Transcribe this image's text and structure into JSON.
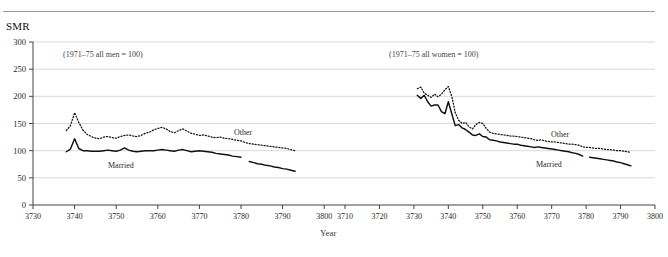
{
  "figure": {
    "y_axis_title": "SMR",
    "x_axis_title": "Year"
  },
  "chart_data": {
    "type": "line",
    "title": "SMR",
    "ylabel": "SMR",
    "xlabel": "Year",
    "ylim": [
      0,
      300
    ],
    "yticks": [
      0,
      50,
      100,
      150,
      200,
      250,
      300
    ],
    "grid": true,
    "legend_position": "inline-labels",
    "panels": [
      {
        "name": "men",
        "annotation": "(1971–75 all men = 100)",
        "xlim": [
          3730,
          3805
        ],
        "xticks": [
          3730,
          3740,
          3750,
          3760,
          3770,
          3780,
          3790,
          3800,
          3810
        ],
        "series": [
          {
            "name": "Other",
            "style": "dotted",
            "label": "Other",
            "x": [
              3738,
              3739,
              3740,
              3741,
              3742,
              3743,
              3744,
              3745,
              3746,
              3747,
              3748,
              3749,
              3750,
              3751,
              3752,
              3753,
              3754,
              3755,
              3756,
              3757,
              3758,
              3759,
              3760,
              3761,
              3762,
              3763,
              3764,
              3765,
              3766,
              3767,
              3768,
              3769,
              3770,
              3771,
              3772,
              3773,
              3774,
              3775,
              3776,
              3777,
              3778,
              3779,
              3780,
              3781,
              3782,
              3783,
              3784,
              3785,
              3786,
              3787,
              3788,
              3789,
              3790,
              3791,
              3792,
              3793
            ],
            "values": [
              137,
              146,
              170,
              152,
              138,
              130,
              126,
              123,
              122,
              125,
              126,
              124,
              123,
              126,
              128,
              129,
              127,
              126,
              128,
              132,
              134,
              138,
              141,
              143,
              140,
              135,
              133,
              137,
              140,
              136,
              132,
              130,
              128,
              129,
              127,
              125,
              124,
              125,
              123,
              122,
              121,
              119,
              118,
              115,
              113,
              112,
              111,
              110,
              109,
              108,
              107,
              106,
              105,
              104,
              102,
              100
            ]
          },
          {
            "name": "Married",
            "style": "solid",
            "label": "Married",
            "segments": [
              {
                "x": [
                  3738,
                  3739,
                  3740,
                  3741,
                  3742,
                  3743,
                  3744,
                  3745,
                  3746,
                  3747,
                  3748,
                  3749,
                  3750,
                  3751,
                  3752,
                  3753,
                  3754,
                  3755,
                  3756,
                  3757,
                  3758,
                  3759,
                  3760,
                  3761,
                  3762,
                  3763,
                  3764,
                  3765,
                  3766,
                  3767,
                  3768,
                  3769,
                  3770,
                  3771,
                  3772,
                  3773,
                  3774,
                  3775,
                  3776,
                  3777,
                  3778,
                  3779,
                  3780
                ],
                "values": [
                  98,
                  103,
                  122,
                  104,
                  100,
                  100,
                  99,
                  99,
                  99,
                  100,
                  101,
                  100,
                  99,
                  101,
                  105,
                  101,
                  99,
                  98,
                  99,
                  100,
                  100,
                  100,
                  101,
                  102,
                  101,
                  100,
                  99,
                  101,
                  102,
                  100,
                  98,
                  99,
                  100,
                  99,
                  98,
                  97,
                  95,
                  94,
                  93,
                  92,
                  90,
                  89,
                  88
                ]
              },
              {
                "x": [
                  3782,
                  3783,
                  3784,
                  3785,
                  3786,
                  3787,
                  3788,
                  3789,
                  3790,
                  3791,
                  3792,
                  3793
                ],
                "values": [
                  80,
                  78,
                  76,
                  75,
                  73,
                  72,
                  70,
                  69,
                  67,
                  66,
                  64,
                  62
                ]
              }
            ]
          }
        ]
      },
      {
        "name": "women",
        "annotation": "(1971–75 all women = 100)",
        "xlim": [
          3710,
          3800
        ],
        "xticks": [
          3710,
          3720,
          3730,
          3740,
          3750,
          3760,
          3770,
          3780,
          3790,
          3800
        ],
        "series": [
          {
            "name": "Other",
            "style": "dotted",
            "label": "Other",
            "x": [
              3731,
              3732,
              3733,
              3734,
              3735,
              3736,
              3737,
              3738,
              3739,
              3740,
              3741,
              3742,
              3743,
              3744,
              3745,
              3746,
              3747,
              3748,
              3749,
              3750,
              3751,
              3752,
              3753,
              3754,
              3755,
              3756,
              3757,
              3758,
              3759,
              3760,
              3761,
              3762,
              3763,
              3764,
              3765,
              3766,
              3767,
              3768,
              3769,
              3770,
              3771,
              3772,
              3773,
              3774,
              3775,
              3776,
              3777,
              3778,
              3779,
              3780,
              3781,
              3782,
              3783,
              3784,
              3785,
              3786,
              3787,
              3788,
              3789,
              3790,
              3791,
              3792,
              3793
            ],
            "values": [
              214,
              217,
              206,
              202,
              198,
              204,
              199,
              204,
              212,
              218,
              200,
              170,
              156,
              150,
              152,
              144,
              140,
              148,
              152,
              150,
              141,
              134,
              132,
              131,
              130,
              129,
              128,
              127,
              127,
              126,
              125,
              124,
              123,
              122,
              120,
              119,
              120,
              118,
              117,
              116,
              116,
              115,
              114,
              113,
              112,
              112,
              111,
              110,
              107,
              106,
              106,
              105,
              104,
              104,
              103,
              102,
              102,
              101,
              100,
              100,
              99,
              98,
              97
            ]
          },
          {
            "name": "Married",
            "style": "solid",
            "label": "Married",
            "segments": [
              {
                "x": [
                  3731,
                  3732,
                  3733,
                  3734,
                  3735,
                  3736,
                  3737,
                  3738,
                  3739,
                  3740,
                  3741,
                  3742,
                  3743,
                  3744,
                  3745,
                  3746,
                  3747,
                  3748,
                  3749,
                  3750,
                  3751,
                  3752,
                  3753,
                  3754,
                  3755,
                  3756,
                  3757,
                  3758,
                  3759,
                  3760,
                  3761,
                  3762,
                  3763,
                  3764,
                  3765,
                  3766,
                  3767,
                  3768,
                  3769,
                  3770,
                  3771,
                  3772,
                  3773,
                  3774,
                  3775,
                  3776,
                  3777,
                  3778,
                  3779
                ],
                "values": [
                  202,
                  196,
                  202,
                  190,
                  182,
                  184,
                  184,
                  172,
                  168,
                  190,
                  168,
                  146,
                  148,
                  142,
                  139,
                  134,
                  129,
                  128,
                  131,
                  126,
                  125,
                  120,
                  119,
                  118,
                  116,
                  115,
                  114,
                  113,
                  112,
                  112,
                  110,
                  109,
                  108,
                  107,
                  106,
                  107,
                  106,
                  105,
                  104,
                  103,
                  102,
                  101,
                  100,
                  99,
                  98,
                  96,
                  95,
                  93,
                  90
                ]
              },
              {
                "x": [
                  3781,
                  3782,
                  3783,
                  3784,
                  3785,
                  3786,
                  3787,
                  3788,
                  3789,
                  3790,
                  3791,
                  3792,
                  3793
                ],
                "values": [
                  88,
                  87,
                  86,
                  85,
                  84,
                  83,
                  82,
                  81,
                  79,
                  78,
                  76,
                  74,
                  72
                ]
              }
            ]
          }
        ]
      }
    ]
  }
}
